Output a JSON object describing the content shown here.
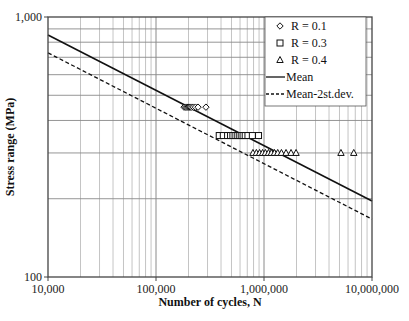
{
  "chart_data": {
    "type": "scatter",
    "title": "",
    "xlabel": "Number of cycles, N",
    "ylabel": "Stress range (MPa)",
    "xscale": "log",
    "yscale": "log",
    "xlim": [
      10000,
      10000000
    ],
    "ylim": [
      100,
      1000
    ],
    "x_ticks": [
      {
        "value": 10000,
        "label": "10,000"
      },
      {
        "value": 100000,
        "label": "100,000"
      },
      {
        "value": 1000000,
        "label": "1,000,000"
      },
      {
        "value": 10000000,
        "label": "10,000,000"
      }
    ],
    "y_ticks": [
      {
        "value": 100,
        "label": "100"
      },
      {
        "value": 1000,
        "label": "1,000"
      }
    ],
    "grid": true,
    "legend_position": "top-right",
    "series": [
      {
        "name": "R = 0.1",
        "marker": "diamond",
        "points": [
          {
            "x": 182000,
            "y": 450
          },
          {
            "x": 188000,
            "y": 450
          },
          {
            "x": 193000,
            "y": 450
          },
          {
            "x": 198000,
            "y": 450
          },
          {
            "x": 203000,
            "y": 450
          },
          {
            "x": 208000,
            "y": 450
          },
          {
            "x": 214000,
            "y": 450
          },
          {
            "x": 222000,
            "y": 450
          },
          {
            "x": 232000,
            "y": 450
          },
          {
            "x": 245000,
            "y": 450
          },
          {
            "x": 290000,
            "y": 450
          }
        ]
      },
      {
        "name": "R = 0.3",
        "marker": "square",
        "points": [
          {
            "x": 385000,
            "y": 350
          },
          {
            "x": 420000,
            "y": 350
          },
          {
            "x": 460000,
            "y": 350
          },
          {
            "x": 490000,
            "y": 350
          },
          {
            "x": 515000,
            "y": 350
          },
          {
            "x": 540000,
            "y": 350
          },
          {
            "x": 565000,
            "y": 350
          },
          {
            "x": 590000,
            "y": 350
          },
          {
            "x": 615000,
            "y": 350
          },
          {
            "x": 640000,
            "y": 350
          },
          {
            "x": 670000,
            "y": 350
          },
          {
            "x": 710000,
            "y": 350
          },
          {
            "x": 780000,
            "y": 350
          },
          {
            "x": 890000,
            "y": 350
          }
        ]
      },
      {
        "name": "R = 0.4",
        "marker": "triangle",
        "points": [
          {
            "x": 790000,
            "y": 300
          },
          {
            "x": 850000,
            "y": 300
          },
          {
            "x": 910000,
            "y": 300
          },
          {
            "x": 970000,
            "y": 300
          },
          {
            "x": 1030000,
            "y": 300
          },
          {
            "x": 1100000,
            "y": 300
          },
          {
            "x": 1170000,
            "y": 300
          },
          {
            "x": 1250000,
            "y": 300
          },
          {
            "x": 1340000,
            "y": 300
          },
          {
            "x": 1450000,
            "y": 300
          },
          {
            "x": 1600000,
            "y": 300
          },
          {
            "x": 1780000,
            "y": 300
          },
          {
            "x": 1980000,
            "y": 300
          },
          {
            "x": 5160000,
            "y": 300
          },
          {
            "x": 6780000,
            "y": 300
          }
        ]
      },
      {
        "name": "Mean",
        "style": "solid-line",
        "points": [
          {
            "x": 10000,
            "y": 853
          },
          {
            "x": 10000000,
            "y": 196
          }
        ]
      },
      {
        "name": "Mean-2st.dev.",
        "style": "dashed-line",
        "points": [
          {
            "x": 10000,
            "y": 728
          },
          {
            "x": 10000000,
            "y": 167
          }
        ]
      }
    ]
  }
}
